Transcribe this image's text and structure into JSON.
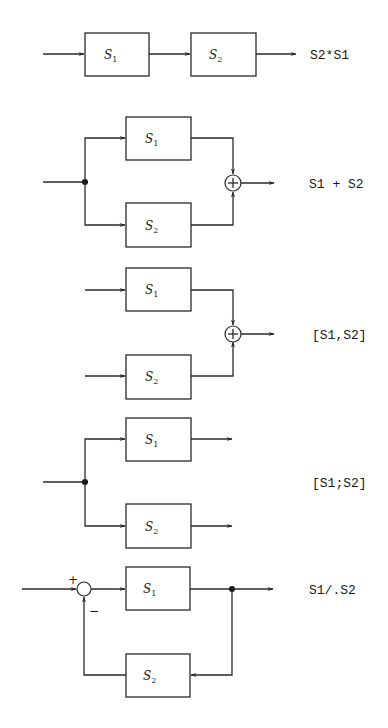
{
  "diagrams": [
    {
      "name": "series",
      "blocks": [
        {
          "main": "S",
          "sub": "1"
        },
        {
          "main": "S",
          "sub": "2"
        }
      ],
      "expression": "S2*S1"
    },
    {
      "name": "parallel",
      "blocks": [
        {
          "main": "S",
          "sub": "1"
        },
        {
          "main": "S",
          "sub": "2"
        }
      ],
      "sum_symbol": "+",
      "expression": "S1 + S2"
    },
    {
      "name": "append-sum",
      "blocks": [
        {
          "main": "S",
          "sub": "1"
        },
        {
          "main": "S",
          "sub": "2"
        }
      ],
      "sum_symbol": "+",
      "expression": "[S1,S2]"
    },
    {
      "name": "stack",
      "blocks": [
        {
          "main": "S",
          "sub": "1"
        },
        {
          "main": "S",
          "sub": "2"
        }
      ],
      "expression": "[S1;S2]"
    },
    {
      "name": "feedback",
      "blocks": [
        {
          "main": "S",
          "sub": "1"
        },
        {
          "main": "S",
          "sub": "2"
        }
      ],
      "plus_sign": "+",
      "minus_sign": "−",
      "expression": "S1/.S2"
    }
  ]
}
